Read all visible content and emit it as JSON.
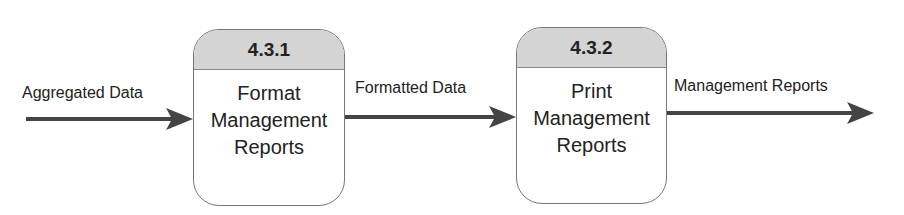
{
  "processes": [
    {
      "id": "4.3.1",
      "name_lines": [
        "Format",
        "Management",
        "Reports"
      ]
    },
    {
      "id": "4.3.2",
      "name_lines": [
        "Print",
        "Management",
        "Reports"
      ]
    }
  ],
  "flows": [
    {
      "label": "Aggregated Data"
    },
    {
      "label": "Formatted Data"
    },
    {
      "label": "Management Reports"
    }
  ],
  "colors": {
    "arrow": "#444444",
    "header_fill": "#d4d4d4",
    "border": "#777777"
  }
}
